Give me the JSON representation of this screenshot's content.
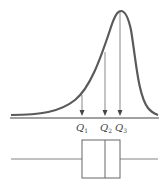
{
  "diagram": {
    "colors": {
      "curve": "#5a5a5a",
      "arrow": "#6a6a6a",
      "axis": "#444444",
      "box": "#666666"
    },
    "labels": {
      "q1": {
        "main": "Q",
        "sub": "1"
      },
      "q2": {
        "main": "Q",
        "sub": "2"
      },
      "q3": {
        "main": "Q",
        "sub": "3"
      }
    }
  }
}
